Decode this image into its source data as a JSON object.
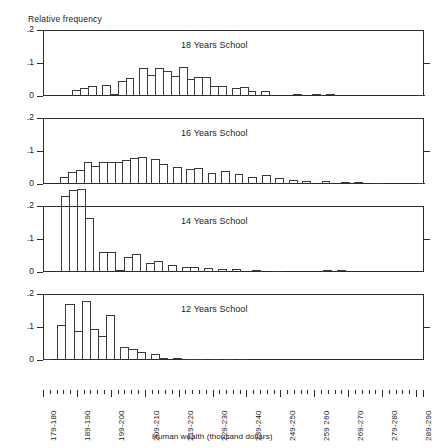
{
  "chart_data": {
    "type": "bar",
    "title": "",
    "ylabel": "Relative frequency",
    "xlabel": "Human wealth (thousand dollars)",
    "ylim": [
      0,
      0.2
    ],
    "yticks": [
      ".2",
      ".1",
      "0"
    ],
    "grid": false,
    "legend": "none",
    "panel_layout": "4 stacked histogram panels sharing one x-axis",
    "categories": [
      "179-180",
      "181-182",
      "183-184",
      "185-186",
      "187-188",
      "189-190",
      "191-192",
      "193-194",
      "195-196",
      "197-198",
      "199-200",
      "201-202",
      "203-204",
      "205-206",
      "207-208",
      "209-210",
      "211-212",
      "213-214",
      "215-216",
      "217-218",
      "219-220",
      "221-222",
      "223-224",
      "225-226",
      "227-228",
      "229-230",
      "231-232",
      "233-234",
      "235-236",
      "237-238",
      "239-240",
      "241-242",
      "243-244",
      "245-246",
      "247-248",
      "249-250",
      "251-252",
      "253-254",
      "255-256",
      "257-258",
      "259-260",
      "261-262",
      "263-264",
      "265-266",
      "267-268",
      "269-270",
      "271-272",
      "273-274",
      "275-276",
      "277-278",
      "279-280",
      "281-282",
      "283-284",
      "285-286",
      "287-288",
      "289-290"
    ],
    "xtick_labels": [
      "179-180",
      "189-190",
      "199-200",
      "209-210",
      "219-220",
      "229-230",
      "239-240",
      "249-250",
      "259 260",
      "269-270",
      "279-280",
      "289-290"
    ],
    "xtick_positions": [
      0,
      5,
      10,
      15,
      20,
      25,
      30,
      35,
      40,
      45,
      50,
      55
    ],
    "series": [
      {
        "name": "18 Years School",
        "values": [
          0.0,
          0.0,
          0.0,
          0.0,
          0.0,
          0.017,
          0.024,
          0.03,
          0.0,
          0.033,
          0.005,
          0.045,
          0.054,
          0.0,
          0.086,
          0.065,
          0.086,
          0.075,
          0.062,
          0.087,
          0.052,
          0.058,
          0.058,
          0.03,
          0.031,
          0.0,
          0.025,
          0.026,
          0.014,
          0.0,
          0.016,
          0.0,
          0.0,
          0.0,
          0.0,
          0.005,
          0.0,
          0.0,
          0.006,
          0.0,
          0.006,
          0.0,
          0.0,
          0.0,
          0.0,
          0.0,
          0.0,
          0.0,
          0.0,
          0.0,
          0.0,
          0.0,
          0.0,
          0.0,
          0.0,
          0.002
        ]
      },
      {
        "name": "16 Years School",
        "values": [
          0.0,
          0.0,
          0.0,
          0.02,
          0.035,
          0.043,
          0.067,
          0.055,
          0.066,
          0.066,
          0.068,
          0.072,
          0.079,
          0.083,
          0.0,
          0.075,
          0.06,
          0.0,
          0.052,
          0.0,
          0.047,
          0.05,
          0.0,
          0.034,
          0.0,
          0.038,
          0.0,
          0.03,
          0.0,
          0.022,
          0.0,
          0.026,
          0.0,
          0.018,
          0.0,
          0.013,
          0.0,
          0.01,
          0.0,
          0.0,
          0.009,
          0.0,
          0.0,
          0.007,
          0.0,
          0.005,
          0.0,
          0.0,
          0.003,
          0.0,
          0.0,
          0.0,
          0.0,
          0.0,
          0.0,
          0.002
        ]
      },
      {
        "name": "14 Years School",
        "values": [
          0.0,
          0.0,
          0.0,
          0.23,
          0.248,
          0.253,
          0.163,
          0.0,
          0.062,
          0.062,
          0.005,
          0.045,
          0.055,
          0.0,
          0.026,
          0.033,
          0.0,
          0.022,
          0.0,
          0.016,
          0.014,
          0.0,
          0.013,
          0.0,
          0.01,
          0.0,
          0.008,
          0.0,
          0.0,
          0.006,
          0.0,
          0.0,
          0.004,
          0.0,
          0.0,
          0.0,
          0.0,
          0.0,
          0.0,
          0.0,
          0.005,
          0.0,
          0.005,
          0.0,
          0.0,
          0.0,
          0.0,
          0.0,
          0.0,
          0.0,
          0.0,
          0.0,
          0.0,
          0.0,
          0.0,
          0.0
        ]
      },
      {
        "name": "12 Years School",
        "values": [
          0.003,
          0.0,
          0.106,
          0.171,
          0.089,
          0.18,
          0.094,
          0.073,
          0.136,
          0.0,
          0.038,
          0.033,
          0.024,
          0.0,
          0.019,
          0.007,
          0.0,
          0.006,
          0.0,
          0.003,
          0.004,
          0.0,
          0.004,
          0.0,
          0.002,
          0.0,
          0.001,
          0.0,
          0.0,
          0.0,
          0.0,
          0.0,
          0.0,
          0.0,
          0.0,
          0.0,
          0.0,
          0.0,
          0.0,
          0.0,
          0.0,
          0.0,
          0.0,
          0.0,
          0.0,
          0.0,
          0.0,
          0.0,
          0.0,
          0.0,
          0.0,
          0.0,
          0.0,
          0.0,
          0.0,
          0.0
        ]
      }
    ]
  },
  "axis": {
    "ylabel_text": "Relative frequency",
    "xlabel_text": "Human wealth (thousand dollars)",
    "tick_hi": ".2",
    "tick_mid": ".1",
    "tick_zero": "0"
  },
  "panels": [
    {
      "title": "18 Years School"
    },
    {
      "title": "16 Years School"
    },
    {
      "title": "14 Years School"
    },
    {
      "title": "12 Years School"
    }
  ],
  "colors": {
    "ink": "#1a1a1a",
    "bar_outline": "#3a3a3a",
    "background": "#ffffff"
  }
}
